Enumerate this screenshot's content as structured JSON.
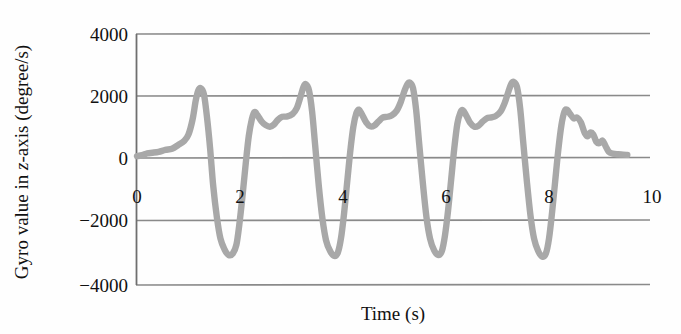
{
  "chart_data": {
    "type": "line",
    "title": "",
    "xlabel": "Time (s)",
    "ylabel": "Gyro value in z-axis (degree/s)",
    "ylabel_parts": {
      "prefix": "Gyro value in ",
      "italic": "z",
      "suffix": "-axis (degree/s)"
    },
    "xlim": [
      0,
      10
    ],
    "ylim": [
      -4000,
      4000
    ],
    "x_ticks": [
      0,
      2,
      4,
      6,
      8,
      10
    ],
    "x_tick_labels": [
      "0",
      "2",
      "4",
      "6",
      "8",
      "10"
    ],
    "y_ticks": [
      4000,
      2000,
      0,
      -2000,
      -4000
    ],
    "y_tick_labels": [
      "4000",
      "2000",
      "0",
      "−2000",
      "−4000"
    ],
    "grid": "horizontal",
    "legend": "none",
    "series": [
      {
        "name": "Gyro z-axis",
        "color": "#a8a8a8",
        "points": [
          [
            0.0,
            60
          ],
          [
            0.1,
            90
          ],
          [
            0.2,
            150
          ],
          [
            0.3,
            170
          ],
          [
            0.42,
            200
          ],
          [
            0.55,
            260
          ],
          [
            0.68,
            300
          ],
          [
            0.8,
            420
          ],
          [
            0.92,
            560
          ],
          [
            1.0,
            760
          ],
          [
            1.08,
            1250
          ],
          [
            1.14,
            1850
          ],
          [
            1.19,
            2180
          ],
          [
            1.24,
            2250
          ],
          [
            1.3,
            2050
          ],
          [
            1.36,
            1300
          ],
          [
            1.42,
            300
          ],
          [
            1.48,
            -900
          ],
          [
            1.55,
            -1900
          ],
          [
            1.62,
            -2600
          ],
          [
            1.7,
            -2950
          ],
          [
            1.78,
            -3130
          ],
          [
            1.86,
            -3080
          ],
          [
            1.93,
            -2800
          ],
          [
            1.99,
            -2100
          ],
          [
            2.05,
            -1200
          ],
          [
            2.11,
            -200
          ],
          [
            2.17,
            700
          ],
          [
            2.23,
            1250
          ],
          [
            2.28,
            1480
          ],
          [
            2.34,
            1380
          ],
          [
            2.42,
            1180
          ],
          [
            2.5,
            1060
          ],
          [
            2.58,
            1010
          ],
          [
            2.66,
            1080
          ],
          [
            2.74,
            1240
          ],
          [
            2.82,
            1330
          ],
          [
            2.92,
            1340
          ],
          [
            3.02,
            1420
          ],
          [
            3.1,
            1600
          ],
          [
            3.17,
            1950
          ],
          [
            3.23,
            2280
          ],
          [
            3.28,
            2380
          ],
          [
            3.34,
            2180
          ],
          [
            3.4,
            1500
          ],
          [
            3.46,
            400
          ],
          [
            3.53,
            -900
          ],
          [
            3.6,
            -1950
          ],
          [
            3.67,
            -2650
          ],
          [
            3.75,
            -3000
          ],
          [
            3.83,
            -3160
          ],
          [
            3.9,
            -3050
          ],
          [
            3.96,
            -2600
          ],
          [
            4.02,
            -1800
          ],
          [
            4.08,
            -800
          ],
          [
            4.14,
            200
          ],
          [
            4.2,
            1000
          ],
          [
            4.26,
            1450
          ],
          [
            4.31,
            1560
          ],
          [
            4.37,
            1400
          ],
          [
            4.45,
            1150
          ],
          [
            4.53,
            1020
          ],
          [
            4.61,
            1050
          ],
          [
            4.69,
            1180
          ],
          [
            4.77,
            1300
          ],
          [
            4.86,
            1330
          ],
          [
            4.95,
            1380
          ],
          [
            5.04,
            1520
          ],
          [
            5.12,
            1800
          ],
          [
            5.19,
            2150
          ],
          [
            5.25,
            2380
          ],
          [
            5.3,
            2430
          ],
          [
            5.36,
            2250
          ],
          [
            5.42,
            1550
          ],
          [
            5.48,
            450
          ],
          [
            5.55,
            -800
          ],
          [
            5.62,
            -1900
          ],
          [
            5.69,
            -2600
          ],
          [
            5.77,
            -2980
          ],
          [
            5.85,
            -3130
          ],
          [
            5.92,
            -3000
          ],
          [
            5.98,
            -2500
          ],
          [
            6.04,
            -1700
          ],
          [
            6.1,
            -700
          ],
          [
            6.16,
            300
          ],
          [
            6.22,
            1100
          ],
          [
            6.28,
            1470
          ],
          [
            6.33,
            1540
          ],
          [
            6.39,
            1380
          ],
          [
            6.47,
            1130
          ],
          [
            6.55,
            1010
          ],
          [
            6.63,
            1040
          ],
          [
            6.71,
            1170
          ],
          [
            6.79,
            1280
          ],
          [
            6.88,
            1310
          ],
          [
            6.97,
            1360
          ],
          [
            7.06,
            1500
          ],
          [
            7.14,
            1780
          ],
          [
            7.21,
            2130
          ],
          [
            7.27,
            2400
          ],
          [
            7.32,
            2450
          ],
          [
            7.38,
            2280
          ],
          [
            7.44,
            1600
          ],
          [
            7.5,
            500
          ],
          [
            7.57,
            -750
          ],
          [
            7.64,
            -1850
          ],
          [
            7.71,
            -2600
          ],
          [
            7.79,
            -3000
          ],
          [
            7.87,
            -3180
          ],
          [
            7.94,
            -3080
          ],
          [
            8.0,
            -2600
          ],
          [
            8.06,
            -1750
          ],
          [
            8.12,
            -750
          ],
          [
            8.18,
            250
          ],
          [
            8.24,
            1050
          ],
          [
            8.3,
            1500
          ],
          [
            8.35,
            1560
          ],
          [
            8.41,
            1420
          ],
          [
            8.48,
            1280
          ],
          [
            8.55,
            1300
          ],
          [
            8.62,
            1150
          ],
          [
            8.69,
            820
          ],
          [
            8.75,
            700
          ],
          [
            8.8,
            820
          ],
          [
            8.86,
            760
          ],
          [
            8.92,
            520
          ],
          [
            8.98,
            480
          ],
          [
            9.04,
            560
          ],
          [
            9.1,
            380
          ],
          [
            9.16,
            200
          ],
          [
            9.24,
            140
          ],
          [
            9.34,
            120
          ],
          [
            9.44,
            110
          ],
          [
            9.52,
            100
          ]
        ]
      }
    ]
  },
  "axes": {
    "x_title": "Time (s)",
    "y_title_prefix": "Gyro value in ",
    "y_title_italic": "z",
    "y_title_suffix": "-axis (degree/s)"
  }
}
